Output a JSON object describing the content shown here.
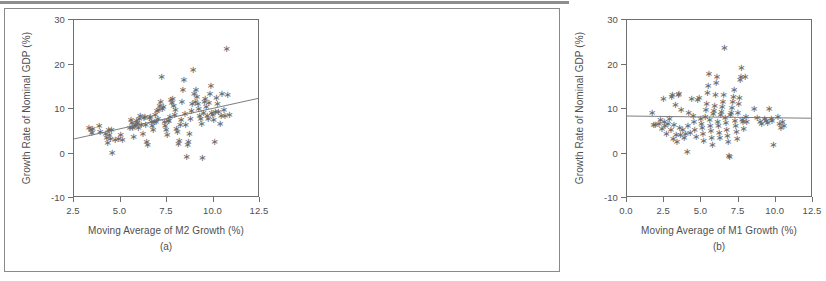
{
  "figure": {
    "background_color": "#ffffff",
    "border_color": "#8a8a8a",
    "axis_color": "#6f6f6f",
    "text_color": "#4f4f4f",
    "marker_color": "#6a6a6a",
    "marker_glyph": "star-asterisk"
  },
  "chart_data": [
    {
      "type": "scatter",
      "panel": "a",
      "panel_label": "(a)",
      "title": "",
      "xlabel": "Moving Average of M2 Growth (%)",
      "ylabel": "Growth Rate of Nominal GDP (%)",
      "xlim": [
        2.5,
        12.5
      ],
      "ylim": [
        -10,
        30
      ],
      "xticks": [
        2.5,
        5.0,
        7.5,
        10.0,
        12.5
      ],
      "xticklabels": [
        "2.5",
        "5.0",
        "7.5",
        "10.0",
        "12.5"
      ],
      "yticks": [
        -10,
        0,
        10,
        20,
        30
      ],
      "yticklabels": [
        "-10",
        "0",
        "10",
        "20",
        "30"
      ],
      "grid": false,
      "legend": false,
      "fit_line": {
        "label": "least-squares fit",
        "x0": 2.5,
        "y0": 3.0,
        "x1": 12.5,
        "y1": 12.2
      },
      "points": [
        [
          3.35,
          5.6
        ],
        [
          3.45,
          5.1
        ],
        [
          3.5,
          4.4
        ],
        [
          3.55,
          5.3
        ],
        [
          3.9,
          6.0
        ],
        [
          3.95,
          4.6
        ],
        [
          4.25,
          4.2
        ],
        [
          4.3,
          3.3
        ],
        [
          4.35,
          2.2
        ],
        [
          4.4,
          5.2
        ],
        [
          4.45,
          4.0
        ],
        [
          4.5,
          3.0
        ],
        [
          4.55,
          5.0
        ],
        [
          4.6,
          0.0
        ],
        [
          4.75,
          2.9
        ],
        [
          4.95,
          3.0
        ],
        [
          5.05,
          4.0
        ],
        [
          5.15,
          2.9
        ],
        [
          5.55,
          5.5
        ],
        [
          5.6,
          7.3
        ],
        [
          5.65,
          6.7
        ],
        [
          5.7,
          5.6
        ],
        [
          5.75,
          3.6
        ],
        [
          5.8,
          6.0
        ],
        [
          5.85,
          6.2
        ],
        [
          5.9,
          7.2
        ],
        [
          5.95,
          6.6
        ],
        [
          6.0,
          5.5
        ],
        [
          6.05,
          7.6
        ],
        [
          6.1,
          8.2
        ],
        [
          6.15,
          6.3
        ],
        [
          6.25,
          4.2
        ],
        [
          6.3,
          7.9
        ],
        [
          6.35,
          8.1
        ],
        [
          6.4,
          6.3
        ],
        [
          6.45,
          2.4
        ],
        [
          6.5,
          1.8
        ],
        [
          6.6,
          7.9
        ],
        [
          6.65,
          8.0
        ],
        [
          6.7,
          6.9
        ],
        [
          6.75,
          6.0
        ],
        [
          6.8,
          5.2
        ],
        [
          6.85,
          7.0
        ],
        [
          6.9,
          8.5
        ],
        [
          6.95,
          6.8
        ],
        [
          7.0,
          9.3
        ],
        [
          7.05,
          7.5
        ],
        [
          7.1,
          9.5
        ],
        [
          7.15,
          10.6
        ],
        [
          7.2,
          11.3
        ],
        [
          7.25,
          17.0
        ],
        [
          7.3,
          9.9
        ],
        [
          7.35,
          10.3
        ],
        [
          7.4,
          7.0
        ],
        [
          7.45,
          6.1
        ],
        [
          7.5,
          5.0
        ],
        [
          7.55,
          3.9
        ],
        [
          7.6,
          7.1
        ],
        [
          7.65,
          7.2
        ],
        [
          7.7,
          8.0
        ],
        [
          7.75,
          11.9
        ],
        [
          7.8,
          11.2
        ],
        [
          7.85,
          12.1
        ],
        [
          7.9,
          10.5
        ],
        [
          7.95,
          8.4
        ],
        [
          8.0,
          9.6
        ],
        [
          8.05,
          5.3
        ],
        [
          8.1,
          4.6
        ],
        [
          8.15,
          2.0
        ],
        [
          8.2,
          2.6
        ],
        [
          8.25,
          6.2
        ],
        [
          8.3,
          7.4
        ],
        [
          8.35,
          11.5
        ],
        [
          8.4,
          14.0
        ],
        [
          8.45,
          16.3
        ],
        [
          8.5,
          8.7
        ],
        [
          8.55,
          6.2
        ],
        [
          8.6,
          -1.0
        ],
        [
          8.65,
          1.8
        ],
        [
          8.7,
          2.4
        ],
        [
          8.75,
          4.2
        ],
        [
          8.8,
          7.6
        ],
        [
          8.85,
          9.3
        ],
        [
          8.9,
          10.9
        ],
        [
          8.95,
          18.5
        ],
        [
          9.0,
          13.3
        ],
        [
          9.05,
          11.4
        ],
        [
          9.1,
          14.0
        ],
        [
          9.15,
          12.6
        ],
        [
          9.2,
          11.0
        ],
        [
          9.25,
          9.8
        ],
        [
          9.3,
          8.3
        ],
        [
          9.35,
          7.6
        ],
        [
          9.4,
          6.5
        ],
        [
          9.45,
          -1.2
        ],
        [
          9.5,
          9.0
        ],
        [
          9.55,
          11.4
        ],
        [
          9.6,
          12.0
        ],
        [
          9.65,
          10.2
        ],
        [
          9.7,
          8.2
        ],
        [
          9.75,
          7.5
        ],
        [
          9.8,
          11.1
        ],
        [
          9.85,
          13.3
        ],
        [
          9.9,
          15.0
        ],
        [
          9.95,
          9.0
        ],
        [
          10.0,
          8.4
        ],
        [
          10.05,
          7.3
        ],
        [
          10.1,
          2.5
        ],
        [
          10.15,
          9.2
        ],
        [
          10.2,
          12.3
        ],
        [
          10.25,
          11.0
        ],
        [
          10.3,
          9.2
        ],
        [
          10.4,
          6.5
        ],
        [
          10.45,
          8.3
        ],
        [
          10.5,
          13.1
        ],
        [
          10.6,
          9.5
        ],
        [
          10.65,
          8.3
        ],
        [
          10.75,
          23.2
        ],
        [
          10.8,
          12.9
        ],
        [
          10.9,
          8.4
        ]
      ]
    },
    {
      "type": "scatter",
      "panel": "b",
      "panel_label": "(b)",
      "title": "",
      "xlabel": "Moving Average of M1 Growth (%)",
      "ylabel": "Growth Rate of Nominal GDP (%)",
      "xlim": [
        0.0,
        12.5
      ],
      "ylim": [
        -10,
        30
      ],
      "xticks": [
        0.0,
        2.5,
        5.0,
        7.5,
        10.0,
        12.5
      ],
      "xticklabels": [
        "0.0",
        "2.5",
        "5.0",
        "7.5",
        "10.0",
        "12.5"
      ],
      "yticks": [
        -10,
        0,
        10,
        20,
        30
      ],
      "yticklabels": [
        "-10",
        "0",
        "10",
        "20",
        "30"
      ],
      "grid": false,
      "legend": false,
      "fit_line": {
        "label": "least-squares fit",
        "x0": 0.0,
        "y0": 8.2,
        "x1": 12.5,
        "y1": 7.7
      },
      "points": [
        [
          1.75,
          9.0
        ],
        [
          1.85,
          6.3
        ],
        [
          1.95,
          6.2
        ],
        [
          2.2,
          6.5
        ],
        [
          2.3,
          7.3
        ],
        [
          2.4,
          5.3
        ],
        [
          2.5,
          12.0
        ],
        [
          2.55,
          7.0
        ],
        [
          2.6,
          5.9
        ],
        [
          2.7,
          4.2
        ],
        [
          2.8,
          6.5
        ],
        [
          2.9,
          7.5
        ],
        [
          3.0,
          5.0
        ],
        [
          3.05,
          12.5
        ],
        [
          3.1,
          13.0
        ],
        [
          3.15,
          3.1
        ],
        [
          3.2,
          6.2
        ],
        [
          3.3,
          10.7
        ],
        [
          3.35,
          4.0
        ],
        [
          3.4,
          2.5
        ],
        [
          3.5,
          13.0
        ],
        [
          3.55,
          13.2
        ],
        [
          3.6,
          5.5
        ],
        [
          3.65,
          3.9
        ],
        [
          3.7,
          9.6
        ],
        [
          3.8,
          5.1
        ],
        [
          3.9,
          3.3
        ],
        [
          4.0,
          4.1
        ],
        [
          4.1,
          0.1
        ],
        [
          4.15,
          6.0
        ],
        [
          4.2,
          9.0
        ],
        [
          4.3,
          4.4
        ],
        [
          4.4,
          12.0
        ],
        [
          4.5,
          8.2
        ],
        [
          4.55,
          6.9
        ],
        [
          4.6,
          5.1
        ],
        [
          4.7,
          3.6
        ],
        [
          4.8,
          11.9
        ],
        [
          4.9,
          12.2
        ],
        [
          5.0,
          7.6
        ],
        [
          5.05,
          6.4
        ],
        [
          5.1,
          5.6
        ],
        [
          5.15,
          4.3
        ],
        [
          5.2,
          2.6
        ],
        [
          5.3,
          8.1
        ],
        [
          5.35,
          9.5
        ],
        [
          5.4,
          11.0
        ],
        [
          5.45,
          13.5
        ],
        [
          5.5,
          15.0
        ],
        [
          5.55,
          17.6
        ],
        [
          5.6,
          7.3
        ],
        [
          5.65,
          6.1
        ],
        [
          5.7,
          4.8
        ],
        [
          5.75,
          3.4
        ],
        [
          5.8,
          1.8
        ],
        [
          5.85,
          8.6
        ],
        [
          5.9,
          9.3
        ],
        [
          5.95,
          10.4
        ],
        [
          6.0,
          12.9
        ],
        [
          6.05,
          15.6
        ],
        [
          6.1,
          17.0
        ],
        [
          6.15,
          7.0
        ],
        [
          6.2,
          5.9
        ],
        [
          6.25,
          4.5
        ],
        [
          6.3,
          3.2
        ],
        [
          6.35,
          8.4
        ],
        [
          6.4,
          9.1
        ],
        [
          6.45,
          10.2
        ],
        [
          6.5,
          11.5
        ],
        [
          6.55,
          13.0
        ],
        [
          6.6,
          23.6
        ],
        [
          6.65,
          7.8
        ],
        [
          6.7,
          6.6
        ],
        [
          6.75,
          5.2
        ],
        [
          6.8,
          3.8
        ],
        [
          6.85,
          2.4
        ],
        [
          6.9,
          -0.8
        ],
        [
          6.95,
          -1.0
        ],
        [
          7.0,
          8.5
        ],
        [
          7.05,
          9.0
        ],
        [
          7.1,
          10.0
        ],
        [
          7.15,
          11.3
        ],
        [
          7.2,
          12.5
        ],
        [
          7.25,
          14.0
        ],
        [
          7.3,
          7.1
        ],
        [
          7.35,
          6.0
        ],
        [
          7.4,
          4.6
        ],
        [
          7.45,
          3.0
        ],
        [
          7.5,
          8.9
        ],
        [
          7.55,
          11.0
        ],
        [
          7.6,
          12.2
        ],
        [
          7.65,
          16.3
        ],
        [
          7.7,
          17.0
        ],
        [
          7.75,
          19.0
        ],
        [
          7.8,
          7.4
        ],
        [
          7.85,
          6.8
        ],
        [
          7.9,
          5.4
        ],
        [
          8.0,
          17.0
        ],
        [
          8.05,
          8.0
        ],
        [
          8.1,
          6.9
        ],
        [
          8.6,
          9.8
        ],
        [
          8.8,
          7.8
        ],
        [
          9.0,
          7.0
        ],
        [
          9.1,
          6.4
        ],
        [
          9.3,
          7.5
        ],
        [
          9.4,
          7.2
        ],
        [
          9.5,
          6.6
        ],
        [
          9.6,
          9.9
        ],
        [
          9.75,
          7.5
        ],
        [
          9.8,
          7.1
        ],
        [
          9.9,
          1.8
        ],
        [
          10.2,
          8.0
        ],
        [
          10.3,
          6.5
        ],
        [
          10.4,
          5.6
        ],
        [
          10.5,
          7.0
        ],
        [
          10.6,
          5.9
        ]
      ]
    }
  ]
}
